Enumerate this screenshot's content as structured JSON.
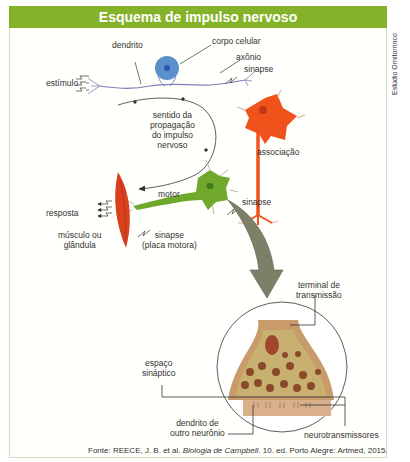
{
  "title": "Esquema de impulso nervoso",
  "credit": "Estúdio Ornitorrinco",
  "labels": {
    "dendrito": "dendrito",
    "corpo_celular": "corpo celular",
    "axonio": "axônio",
    "sinapse_top": "sinapse",
    "estimulo": "estímulo",
    "sentido": [
      "sentido da",
      "propagação",
      "do impulso",
      "nervoso"
    ],
    "associacao": "associação",
    "motor": "motor",
    "sinapse_mid": "sinapse",
    "resposta": "resposta",
    "musculo": [
      "músculo ou",
      "glândula"
    ],
    "sinapse_placa": [
      "sinapse",
      "(placa motora)"
    ],
    "terminal": [
      "terminal de",
      "transmissão"
    ],
    "espaco": [
      "espaço",
      "sináptico"
    ],
    "dendrito_outro": [
      "dendrito de",
      "outro neurônio"
    ],
    "neurotransmissores": "neurotransmissores"
  },
  "source": {
    "prefix": "Fonte: REECE, J. B. et al. ",
    "title": "Biologia de Campbell",
    "suffix": ". 10. ed. Porto Alegre: Artmed, 2015."
  },
  "colors": {
    "header": "#84b229",
    "sensory_body": "#5b8fc9",
    "association_neuron": "#f0521c",
    "motor_neuron": "#6fa82a",
    "muscle": "#d8401e",
    "arrow": "#7d8066",
    "terminal": "#c99a6a"
  }
}
